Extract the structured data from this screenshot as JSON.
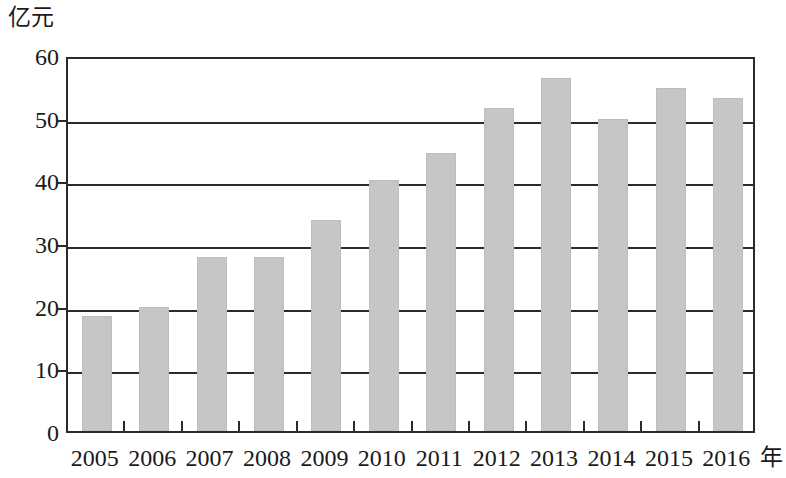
{
  "chart_data": {
    "type": "bar",
    "title": "",
    "subtitle": "",
    "xlabel": "年",
    "ylabel": "亿元",
    "categories": [
      "2005",
      "2006",
      "2007",
      "2008",
      "2009",
      "2010",
      "2011",
      "2012",
      "2013",
      "2014",
      "2015",
      "2016"
    ],
    "values": [
      18.3,
      19.8,
      27.7,
      27.7,
      33.7,
      40.0,
      44.3,
      51.6,
      56.4,
      49.8,
      54.7,
      53.2
    ],
    "series": [
      {
        "name": "",
        "values": [
          18.3,
          19.8,
          27.7,
          27.7,
          33.7,
          40.0,
          44.3,
          51.6,
          56.4,
          49.8,
          54.7,
          53.2
        ]
      }
    ],
    "ylim": [
      0,
      60
    ],
    "yticks": [
      0,
      10,
      20,
      30,
      40,
      50,
      60
    ],
    "ytick_labels": [
      "0",
      "10",
      "20",
      "30",
      "40",
      "50",
      "60"
    ],
    "grid": true,
    "grid_axis": "y",
    "legend": false,
    "legend_position": "none",
    "bar_color": "#c6c6c6",
    "axis_color": "#2b2b2b",
    "background_color": "#ffffff"
  },
  "axes": {
    "y_unit_label": "亿元",
    "x_unit_label": "年"
  }
}
